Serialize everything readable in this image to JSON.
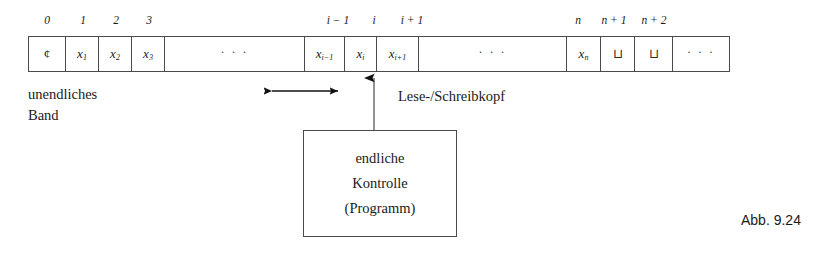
{
  "figure": {
    "caption": "Abb. 9.24",
    "kind": "turing-machine-diagram"
  },
  "tape": {
    "left_px": 28,
    "top_px": 36,
    "height_px": 36,
    "indices": [
      {
        "label": "0",
        "center_x": 47
      },
      {
        "label": "1",
        "center_x": 83
      },
      {
        "label": "2",
        "center_x": 116
      },
      {
        "label": "3",
        "center_x": 149
      },
      {
        "label": "i − 1",
        "center_x": 338
      },
      {
        "label": "i",
        "center_x": 374
      },
      {
        "label": "i + 1",
        "center_x": 412
      },
      {
        "label": "n",
        "center_x": 578
      },
      {
        "label": "n + 1",
        "center_x": 614
      },
      {
        "label": "n + 2",
        "center_x": 654
      }
    ],
    "cells": [
      {
        "name": "cell-endmarker",
        "content": "¢",
        "kind": "symbol",
        "width": 37
      },
      {
        "name": "cell-x1",
        "content": "x",
        "kind": "var",
        "sub": "1",
        "width": 33
      },
      {
        "name": "cell-x2",
        "content": "x",
        "kind": "var",
        "sub": "2",
        "width": 33
      },
      {
        "name": "cell-x3",
        "content": "x",
        "kind": "var",
        "sub": "3",
        "width": 33
      },
      {
        "name": "cell-ellipsis-left",
        "content": "· · ·",
        "kind": "ellipsis",
        "width": 140
      },
      {
        "name": "cell-xi-minus-1",
        "content": "x",
        "kind": "var",
        "sub": "i−1",
        "width": 40
      },
      {
        "name": "cell-xi",
        "content": "x",
        "kind": "var",
        "sub": "i",
        "width": 32
      },
      {
        "name": "cell-xi-plus-1",
        "content": "x",
        "kind": "var",
        "sub": "i+1",
        "width": 42
      },
      {
        "name": "cell-ellipsis-middle",
        "content": "· · ·",
        "kind": "ellipsis",
        "width": 148
      },
      {
        "name": "cell-xn",
        "content": "x",
        "kind": "var",
        "sub": "n",
        "width": 34
      },
      {
        "name": "cell-blank-1",
        "content": "⊔",
        "kind": "blank",
        "width": 34
      },
      {
        "name": "cell-blank-2",
        "content": "⊔",
        "kind": "blank",
        "width": 38
      },
      {
        "name": "cell-ellipsis-right",
        "content": "· · ·",
        "kind": "ellipsis",
        "width": 56
      }
    ]
  },
  "annotations": {
    "tape_label_line1": "unendliches",
    "tape_label_line2": "Band",
    "head_label": "Lese-/Schreibkopf"
  },
  "control": {
    "line1": "endliche",
    "line2": "Kontrolle",
    "line3": "(Programm)"
  },
  "colors": {
    "ink": "#1a1a1a",
    "stroke": "#4a4a4a",
    "background": "#ffffff"
  }
}
